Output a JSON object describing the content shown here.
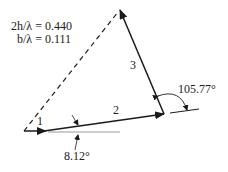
{
  "parameters": {
    "line1": "2h/λ = 0.440",
    "line2": "b/λ = 0.111"
  },
  "vectors": [
    {
      "label": "1"
    },
    {
      "label": "2"
    },
    {
      "label": "3"
    }
  ],
  "angles": {
    "angle_2": "8.12°",
    "angle_3": "105.77°"
  },
  "colors": {
    "stroke": "#1a1a1a",
    "reference": "#999999"
  }
}
